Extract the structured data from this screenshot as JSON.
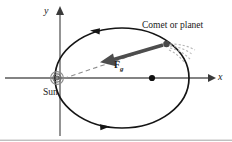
{
  "figure": {
    "title_visible": false,
    "background_color": "#ffffff",
    "stroke_color": "#1a1a1a",
    "axis_color": "#555555",
    "dashed_color": "#888888",
    "force_arrow_color": "#4a4a4a",
    "tail_color": "#b0b0b0"
  },
  "labels": {
    "x_axis": "x",
    "y_axis": "y",
    "sun": "Sun",
    "comet": "Comet or planet",
    "force": "F",
    "force_subscript": "g"
  },
  "diagram_data": {
    "type": "physics-orbit-diagram",
    "ellipse": {
      "center": [
        122,
        78
      ],
      "semi_major_axis_px": 67,
      "semi_minor_axis_px": 50
    },
    "focus_left_sun": [
      57,
      78
    ],
    "focus_right_dot": [
      187,
      78
    ],
    "comet_position": [
      167,
      44
    ],
    "force_vector": {
      "from": [
        167,
        44
      ],
      "to": [
        105,
        62
      ],
      "label": "Fg",
      "points_toward": "Sun"
    },
    "radius_line": {
      "from": [
        167,
        44
      ],
      "to": [
        60,
        80
      ],
      "style": "dashed"
    },
    "orbit_direction_arrows": [
      {
        "at": [
          97,
          33
        ],
        "pointing": "left"
      },
      {
        "at": [
          103,
          112
        ],
        "pointing": "right"
      }
    ],
    "comet_tail": {
      "origin": [
        167,
        44
      ],
      "direction": "away-from-sun",
      "style": "dashed-streaks"
    },
    "axes": {
      "x_axis": {
        "from": [
          5,
          78
        ],
        "to": [
          213,
          78
        ],
        "arrowhead": "right"
      },
      "y_axis": {
        "from": [
          60,
          136
        ],
        "to": [
          60,
          8
        ],
        "arrowhead": "up"
      }
    },
    "frame_bottom_rule": true
  }
}
